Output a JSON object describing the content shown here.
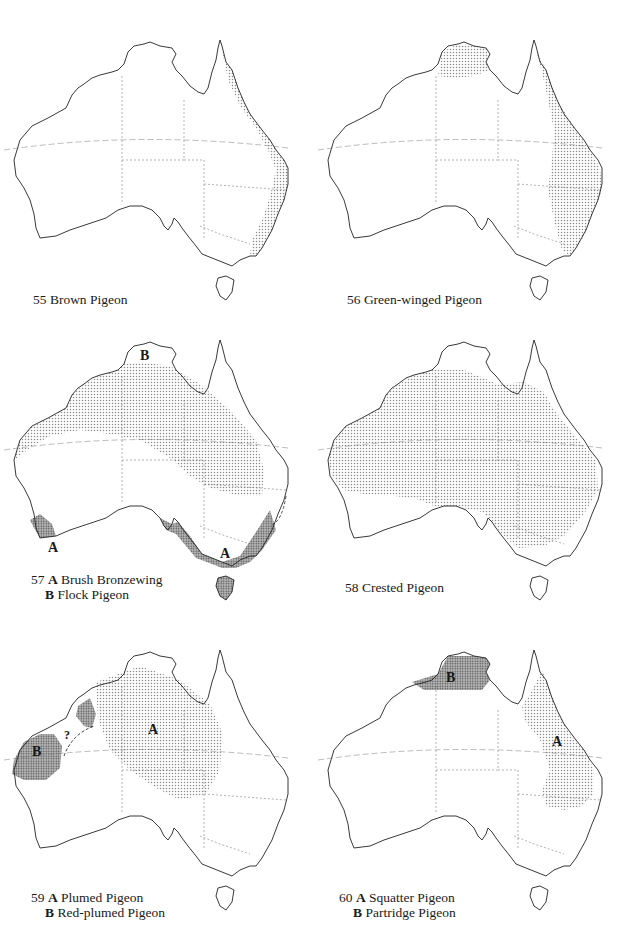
{
  "page": {
    "colors": {
      "background": "#ffffff",
      "outline": "#222222",
      "stipple_light": "#9a9a9a",
      "stipple_dark": "#555555"
    }
  },
  "maps": [
    {
      "number": "55",
      "caption_lines": [
        {
          "letter": "",
          "species": "Brown Pigeon"
        }
      ],
      "ranges": [
        "East coast strip from Cape York to Victoria"
      ]
    },
    {
      "number": "56",
      "caption_lines": [
        {
          "letter": "",
          "species": "Green-winged Pigeon"
        }
      ],
      "ranges": [
        "Top End (Arnhem Land)",
        "Eastern Queensland and NSW"
      ]
    },
    {
      "number": "57",
      "caption_lines": [
        {
          "letter": "A",
          "species": "Brush Bronzewing"
        },
        {
          "letter": "B",
          "species": "Flock Pigeon"
        }
      ],
      "map_labels": [
        "A",
        "A",
        "B"
      ],
      "ranges": [
        "A: south-west WA, south-east Australia & Tasmania",
        "B: northern interior band"
      ]
    },
    {
      "number": "58",
      "caption_lines": [
        {
          "letter": "",
          "species": "Crested Pigeon"
        }
      ],
      "ranges": [
        "Most of mainland Australia except far north, south-west and south-east coast"
      ]
    },
    {
      "number": "59",
      "caption_lines": [
        {
          "letter": "A",
          "species": "Plumed Pigeon"
        },
        {
          "letter": "B",
          "species": "Red-plumed Pigeon"
        }
      ],
      "map_labels": [
        "A",
        "B",
        "?"
      ],
      "ranges": [
        "A: central interior",
        "B: Pilbara region WA"
      ]
    },
    {
      "number": "60",
      "caption_lines": [
        {
          "letter": "A",
          "species": "Squatter Pigeon"
        },
        {
          "letter": "B",
          "species": "Partridge Pigeon"
        }
      ],
      "map_labels": [
        "A",
        "B"
      ],
      "ranges": [
        "A: eastern Queensland inland",
        "B: Top End"
      ]
    }
  ]
}
